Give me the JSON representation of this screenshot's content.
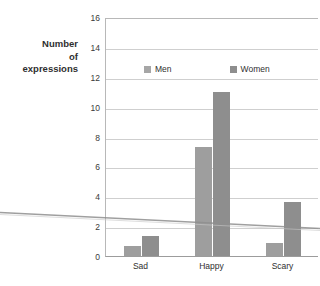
{
  "header": {
    "cropped_fragment": ""
  },
  "chart_data": {
    "type": "bar",
    "title": "",
    "xlabel": "",
    "ylabel": "Number of expressions",
    "ylabel_lines": [
      "Number",
      "of",
      "expressions"
    ],
    "categories": [
      "Sad",
      "Happy",
      "Scary"
    ],
    "series": [
      {
        "name": "Men",
        "color": "#9e9e9e",
        "values": [
          0.7,
          7.3,
          0.85
        ]
      },
      {
        "name": "Women",
        "color": "#8e8e8e",
        "values": [
          1.35,
          11.0,
          3.6
        ]
      }
    ],
    "ylim": [
      0,
      16
    ],
    "ytick_step": 2,
    "yticks": [
      16,
      14,
      12,
      10,
      8,
      6,
      4,
      2,
      0
    ],
    "grid": true,
    "legend_position": "inside-top-center",
    "legend": [
      "Men",
      "Women"
    ],
    "annotations": []
  },
  "artifacts": {
    "scan_line_color": "#9a9a9a",
    "scan_line_label": "diagonal-scan-artifact"
  }
}
